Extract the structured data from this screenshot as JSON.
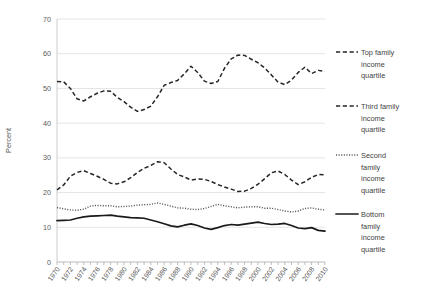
{
  "chart_data": {
    "type": "line",
    "title": "",
    "xlabel": "",
    "ylabel": "Percent",
    "ylim": [
      0,
      70
    ],
    "xlim": [
      1970,
      2010
    ],
    "ytick_step": 10,
    "yticks": [
      "0",
      "10",
      "20",
      "30",
      "40",
      "50",
      "60",
      "70"
    ],
    "grid": true,
    "legend_position": "right",
    "x": [
      1970,
      1971,
      1972,
      1973,
      1974,
      1975,
      1976,
      1977,
      1978,
      1979,
      1980,
      1981,
      1982,
      1983,
      1984,
      1985,
      1986,
      1987,
      1988,
      1989,
      1990,
      1991,
      1992,
      1993,
      1994,
      1995,
      1996,
      1997,
      1998,
      1999,
      2000,
      2001,
      2002,
      2003,
      2004,
      2005,
      2006,
      2007,
      2008,
      2009,
      2010
    ],
    "xticklabels": [
      "1970",
      "1972",
      "1974",
      "1976",
      "1978",
      "1980",
      "1982",
      "1984",
      "1986",
      "1988",
      "1990",
      "1992",
      "1994",
      "1996",
      "1998",
      "2000",
      "2002",
      "2004",
      "2006",
      "2008",
      "2010"
    ],
    "series": [
      {
        "name": "Top family income quartile",
        "style": "dashed",
        "color": "#262626",
        "values": [
          52.0,
          51.9,
          50.0,
          47.0,
          46.4,
          47.6,
          48.6,
          49.3,
          49.2,
          47.4,
          46.2,
          44.6,
          43.4,
          43.9,
          44.9,
          47.6,
          50.9,
          51.7,
          52.3,
          54.2,
          56.4,
          54.6,
          52.1,
          51.4,
          52.0,
          55.8,
          58.5,
          59.6,
          59.5,
          58.4,
          57.4,
          55.9,
          53.9,
          51.8,
          51.1,
          52.4,
          54.6,
          56.1,
          54.3,
          55.2,
          54.9
        ]
      },
      {
        "name": "Third family income quartile",
        "style": "dashed",
        "color": "#262626",
        "values": [
          20.8,
          22.2,
          24.7,
          25.8,
          26.3,
          25.5,
          24.7,
          23.8,
          22.7,
          22.5,
          23.1,
          24.3,
          25.8,
          27.0,
          27.8,
          28.9,
          28.6,
          26.8,
          25.2,
          24.5,
          23.6,
          23.9,
          23.8,
          23.2,
          22.3,
          21.6,
          21.0,
          20.3,
          20.4,
          21.2,
          22.4,
          24.0,
          25.7,
          26.2,
          25.2,
          23.6,
          22.3,
          23.1,
          24.4,
          25.2,
          25.1
        ]
      },
      {
        "name": "Second family income quartile",
        "style": "dotted",
        "color": "#595959",
        "values": [
          15.7,
          15.3,
          15.0,
          14.9,
          15.2,
          16.1,
          16.3,
          16.2,
          16.2,
          15.9,
          16.0,
          16.1,
          16.4,
          16.5,
          16.6,
          17.0,
          16.6,
          16.1,
          15.6,
          15.5,
          15.2,
          15.1,
          15.4,
          16.0,
          16.6,
          16.2,
          15.9,
          15.6,
          15.8,
          15.9,
          15.9,
          15.5,
          15.5,
          15.1,
          14.7,
          14.4,
          14.7,
          15.4,
          15.6,
          15.2,
          15.0
        ]
      },
      {
        "name": "Bottom family income quartile",
        "style": "solid",
        "color": "#1a1a1a",
        "values": [
          11.9,
          12.0,
          12.1,
          12.6,
          13.0,
          13.2,
          13.3,
          13.4,
          13.5,
          13.2,
          13.0,
          12.8,
          12.7,
          12.6,
          12.1,
          11.6,
          11.0,
          10.4,
          10.1,
          10.6,
          11.0,
          10.5,
          9.8,
          9.4,
          9.9,
          10.5,
          10.8,
          10.6,
          10.9,
          11.2,
          11.5,
          11.1,
          10.8,
          10.9,
          11.1,
          10.5,
          9.8,
          9.6,
          9.9,
          9.1,
          8.9
        ]
      }
    ]
  },
  "legend": {
    "items": [
      {
        "label_lines": [
          "Top family",
          "income",
          "quartile"
        ],
        "style": "dashed"
      },
      {
        "label_lines": [
          "Third family",
          "income",
          "quartile"
        ],
        "style": "dashed"
      },
      {
        "label_lines": [
          "Second",
          "family",
          "income",
          "quartile"
        ],
        "style": "dotted"
      },
      {
        "label_lines": [
          "Bottom",
          "family",
          "income",
          "quartile"
        ],
        "style": "solid"
      }
    ]
  }
}
